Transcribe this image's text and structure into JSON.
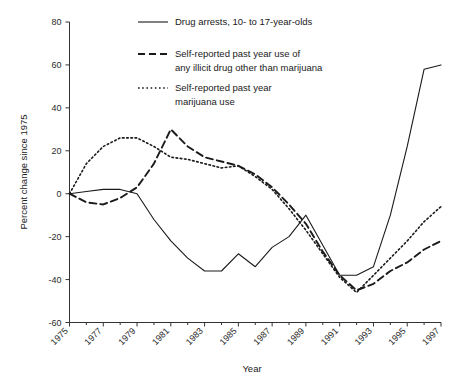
{
  "chart_data": {
    "type": "line",
    "title": "",
    "xlabel": "Year",
    "ylabel": "Percent change since 1975",
    "xlim": [
      1975,
      1997
    ],
    "ylim": [
      -60,
      80
    ],
    "yticks": [
      -60,
      -40,
      -20,
      0,
      20,
      40,
      60,
      80
    ],
    "ytick_labels": [
      "-60",
      "-40",
      "-20",
      "0",
      "20",
      "40",
      "60",
      "80"
    ],
    "xticks": [
      1975,
      1977,
      1979,
      1981,
      1983,
      1985,
      1987,
      1989,
      1991,
      1993,
      1995,
      1997
    ],
    "xtick_labels": [
      "1975",
      "1977",
      "1979",
      "1981",
      "1983",
      "1985",
      "1987",
      "1989",
      "1991",
      "1993",
      "1995",
      "1997"
    ],
    "x": [
      1975,
      1976,
      1977,
      1978,
      1979,
      1980,
      1981,
      1982,
      1983,
      1984,
      1985,
      1986,
      1987,
      1988,
      1989,
      1990,
      1991,
      1992,
      1993,
      1994,
      1995,
      1996,
      1997
    ],
    "grid": false,
    "legend_position": "top-center",
    "series": [
      {
        "name": "Drug arrests, 10- to 17-year-olds",
        "style": "solid",
        "values": [
          0,
          1,
          2,
          2,
          0,
          -12,
          -22,
          -30,
          -36,
          -36,
          -28,
          -34,
          -25,
          -20,
          -10,
          -24,
          -38,
          -38,
          -34,
          -10,
          22,
          58,
          60
        ]
      },
      {
        "name": "Self-reported past year use of any illicit drug other than marijuana",
        "style": "dashed",
        "values": [
          0,
          -4,
          -5,
          -2,
          3,
          14,
          30,
          22,
          17,
          15,
          13,
          9,
          3,
          -5,
          -14,
          -27,
          -38,
          -45,
          -42,
          -36,
          -32,
          -26,
          -22
        ]
      },
      {
        "name": "Self-reported past year marijuana use",
        "style": "dotted",
        "values": [
          0,
          14,
          22,
          26,
          26,
          22,
          17,
          16,
          14,
          12,
          13,
          8,
          2,
          -7,
          -17,
          -28,
          -39,
          -46,
          -38,
          -30,
          -22,
          -13,
          -6
        ]
      }
    ]
  },
  "legend": {
    "entries": [
      {
        "label_line1": "Drug arrests, 10- to 17-year-olds",
        "label_line2": "",
        "sample": "solid-line-sample"
      },
      {
        "label_line1": "Self-reported past year use of",
        "label_line2": "any illicit drug other than marijuana",
        "sample": "dashed-line-sample"
      },
      {
        "label_line1": "Self-reported past year",
        "label_line2": "marijuana use",
        "sample": "dotted-line-sample"
      }
    ]
  },
  "axes": {
    "x_title": "Year",
    "y_title": "Percent change since 1975"
  }
}
